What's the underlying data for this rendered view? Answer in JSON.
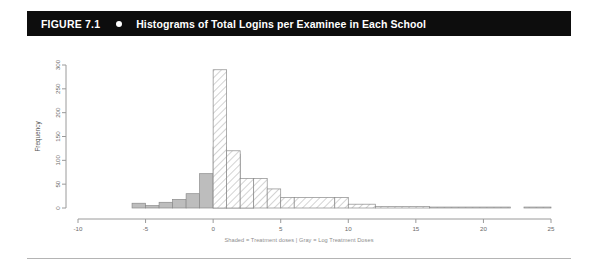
{
  "figure": {
    "number_label": "FIGURE 7.1",
    "bullet_icon": "filled-circle-icon",
    "title": "Histograms of Total Logins per Examinee in Each School",
    "caption": "Shaded = Treatment doses | Gray = Log Treatment Doses",
    "header_background": "#0d0d0d",
    "header_text_color": "#ffffff"
  },
  "chart_data": {
    "type": "bar",
    "title": "Histograms of Total Logins per Examinee in Each School",
    "subtitle": "Shaded = Treatment doses | Gray = Log Treatment Doses",
    "xlabel": "",
    "ylabel": "Frequency",
    "xlim": [
      -10,
      25
    ],
    "ylim": [
      0,
      300
    ],
    "xticks": [
      -10,
      -5,
      0,
      5,
      10,
      15,
      20,
      25
    ],
    "xtick_labels": [
      "-10",
      "-5",
      "0",
      "5",
      "10",
      "15",
      "20",
      "25"
    ],
    "yticks": [
      0,
      50,
      100,
      150,
      200,
      250,
      300
    ],
    "ytick_labels": [
      "0",
      "50",
      "100",
      "150",
      "200",
      "250",
      "300"
    ],
    "grid": false,
    "legend_position": "below-axis-caption",
    "bin_width": 1,
    "series": [
      {
        "name": "Log Treatment Doses",
        "style": "gray",
        "color": "#bdbdbd",
        "bins": [
          {
            "x0": -6,
            "x1": -5,
            "value": 10
          },
          {
            "x0": -5,
            "x1": -4,
            "value": 5
          },
          {
            "x0": -4,
            "x1": -3,
            "value": 12
          },
          {
            "x0": -3,
            "x1": -2,
            "value": 18
          },
          {
            "x0": -2,
            "x1": -1,
            "value": 30
          },
          {
            "x0": -1,
            "x1": 0,
            "value": 72
          },
          {
            "x0": 0,
            "x1": 1,
            "value": 128
          },
          {
            "x0": 1,
            "x1": 2,
            "value": 113
          },
          {
            "x0": 2,
            "x1": 3,
            "value": 30
          }
        ]
      },
      {
        "name": "Treatment doses",
        "style": "hatched",
        "color": "#ffffff",
        "bins": [
          {
            "x0": 0,
            "x1": 1,
            "value": 290
          },
          {
            "x0": 1,
            "x1": 2,
            "value": 120
          },
          {
            "x0": 2,
            "x1": 3,
            "value": 62
          },
          {
            "x0": 3,
            "x1": 4,
            "value": 62
          },
          {
            "x0": 4,
            "x1": 5,
            "value": 40
          },
          {
            "x0": 5,
            "x1": 6,
            "value": 22
          },
          {
            "x0": 6,
            "x1": 9,
            "value": 22
          },
          {
            "x0": 9,
            "x1": 10,
            "value": 22
          },
          {
            "x0": 10,
            "x1": 12,
            "value": 8
          },
          {
            "x0": 12,
            "x1": 16,
            "value": 3
          },
          {
            "x0": 16,
            "x1": 22,
            "value": 2
          },
          {
            "x0": 23,
            "x1": 25,
            "value": 2
          }
        ]
      }
    ]
  }
}
